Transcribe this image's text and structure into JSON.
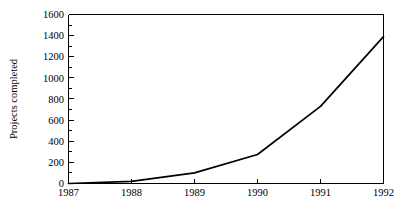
{
  "chart_data": {
    "type": "line",
    "title": "",
    "subtitle": "",
    "xlabel": "",
    "ylabel": "Projects completed",
    "categories": [
      "1987",
      "1988",
      "1989",
      "1990",
      "1991",
      "1992"
    ],
    "x": [
      1987,
      1988,
      1989,
      1990,
      1991,
      1992
    ],
    "values": [
      0,
      20,
      100,
      275,
      730,
      1390
    ],
    "series": [
      {
        "name": "Projects completed",
        "values": [
          0,
          20,
          100,
          275,
          730,
          1390
        ],
        "color": "#000000"
      }
    ],
    "xlim": [
      1987,
      1992
    ],
    "ylim": [
      0,
      1600
    ],
    "y_ticks": [
      0,
      200,
      400,
      600,
      800,
      1000,
      1200,
      1400,
      1600
    ],
    "y_tick_labels": [
      "0",
      "200",
      "400",
      "600",
      "800",
      "1000",
      "1200",
      "1400",
      "1600"
    ],
    "y_minor_tick_step": 100,
    "x_ticks": [
      1987,
      1988,
      1989,
      1990,
      1991,
      1992
    ],
    "x_tick_labels": [
      "1987",
      "1988",
      "1989",
      "1990",
      "1991",
      "1992"
    ],
    "grid": false,
    "legend": false,
    "legend_position": "none",
    "background_color": "#ffffff",
    "axis_color": "#000000",
    "annotations": []
  },
  "figure": {
    "y_axis_title": "Projects completed"
  }
}
